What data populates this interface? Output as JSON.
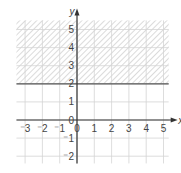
{
  "figure": {
    "part_label": ")",
    "x_axis_label": "x",
    "y_axis_label": "y",
    "x_ticks": [
      {
        "value": -3,
        "label": "⁻3"
      },
      {
        "value": -2,
        "label": "⁻2"
      },
      {
        "value": -1,
        "label": "⁻1"
      },
      {
        "value": 0,
        "label": "0"
      },
      {
        "value": 1,
        "label": "1"
      },
      {
        "value": 2,
        "label": "2"
      },
      {
        "value": 3,
        "label": "3"
      },
      {
        "value": 4,
        "label": "4"
      },
      {
        "value": 5,
        "label": "5"
      }
    ],
    "y_ticks": [
      {
        "value": -2,
        "label": "⁻2"
      },
      {
        "value": -1,
        "label": "⁻1"
      },
      {
        "value": 0,
        "label": "0"
      },
      {
        "value": 1,
        "label": "1"
      },
      {
        "value": 2,
        "label": "2"
      },
      {
        "value": 3,
        "label": "3"
      },
      {
        "value": 4,
        "label": "4"
      },
      {
        "value": 5,
        "label": "5"
      }
    ],
    "x_range": [
      -3.5,
      5.3
    ],
    "y_range": [
      -2.4,
      5.5
    ],
    "boundary_line": {
      "equation": "y = 2",
      "y": 2,
      "style": "solid"
    },
    "shaded_region": {
      "inequality": "y >= 2",
      "from_y": 2,
      "to_y": 5.5,
      "pattern": "diagonal-hatch"
    },
    "colors": {
      "grid": "#d4d4d4",
      "axis": "#333333",
      "boundary": "#555555",
      "hatch": "#c8c8c8",
      "label": "#444444"
    }
  }
}
